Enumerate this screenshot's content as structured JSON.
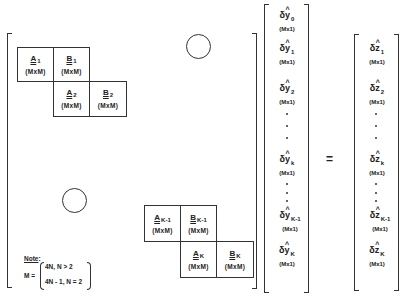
{
  "diagram": {
    "matrix": {
      "blocks": [
        {
          "id": "A1",
          "symbol": "A",
          "sub": "1",
          "dim": "(MxM)"
        },
        {
          "id": "B1",
          "symbol": "B",
          "sub": "1",
          "dim": "(MxM)"
        },
        {
          "id": "A2",
          "symbol": "A",
          "sub": "2",
          "dim": "(MxM)"
        },
        {
          "id": "B2",
          "symbol": "B",
          "sub": "2",
          "dim": "(MxM)"
        },
        {
          "id": "AK-1",
          "symbol": "A",
          "sub": "K-1",
          "dim": "(MxM)"
        },
        {
          "id": "BK-1",
          "symbol": "B",
          "sub": "K-1",
          "dim": "(MxM)"
        },
        {
          "id": "AK",
          "symbol": "A",
          "sub": "K",
          "dim": "(MxM)"
        },
        {
          "id": "BK",
          "symbol": "B",
          "sub": "K",
          "dim": "(MxM)"
        }
      ],
      "zero_marker": "○"
    },
    "note": {
      "label": "Note",
      "colon": ":",
      "lhs": "M =",
      "case1": "4N,  N > 2",
      "case2": "4N - 1,  N = 2"
    },
    "y_vector": {
      "items": [
        {
          "symbol": "δy",
          "hat": "^",
          "sub": "0",
          "dim": "(Mx1)"
        },
        {
          "symbol": "δy",
          "hat": "^",
          "sub": "1",
          "dim": "(Mx1)"
        },
        {
          "symbol": "δy",
          "hat": "^",
          "sub": "2",
          "dim": "(Mx1)"
        },
        {
          "symbol": "δy",
          "hat": "^",
          "sub": "k",
          "dim": "(Mx1)"
        },
        {
          "symbol": "δy",
          "hat": "^",
          "sub": "K-1",
          "dim": "(Mx1)"
        },
        {
          "symbol": "δy",
          "hat": "^",
          "sub": "K",
          "dim": "(Mx1)"
        }
      ]
    },
    "equals": "=",
    "z_vector": {
      "items": [
        {
          "symbol": "δz",
          "hat": "^",
          "sub": "1",
          "dim": "(Mx1)"
        },
        {
          "symbol": "δz",
          "hat": "^",
          "sub": "2",
          "dim": "(Mx1)"
        },
        {
          "symbol": "δz",
          "hat": "^",
          "sub": "k",
          "dim": "(Mx1)"
        },
        {
          "symbol": "δz",
          "hat": "^",
          "sub": "K-1",
          "dim": "(Mx1)"
        },
        {
          "symbol": "δz",
          "hat": "^",
          "sub": "K",
          "dim": "(Mx1)"
        }
      ]
    }
  }
}
